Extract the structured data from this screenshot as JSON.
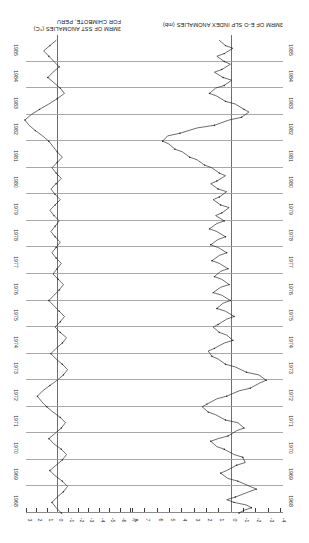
{
  "figure": {
    "rotation_degrees": 180,
    "background": "#ffffff",
    "line_color": "#1d1d1d",
    "grid_color": "#9a9a9a",
    "axis_color": "#2b2b2b"
  },
  "captions": {
    "slp": {
      "line1": "3MRM OF E-O SLP INDEX ANOMALIES (mb)"
    },
    "sst": {
      "line1": "3MRM OF SST ANOMALIES (°C)",
      "line2": "FOR CHIMBOTE, PERU"
    }
  },
  "axes": {
    "slp_ticks": [
      "-4",
      "-3",
      "-2",
      "-1",
      "0",
      "1",
      "2",
      "3",
      "4",
      "5",
      "6",
      "7",
      "8"
    ],
    "sst_ticks": [
      "-7",
      "-6",
      "-5",
      "-4",
      "-3",
      "-2",
      "-1",
      "0",
      "1",
      "2",
      "3"
    ],
    "years": [
      "1968",
      "1969",
      "1970",
      "1971",
      "1972",
      "1973",
      "1974",
      "1975",
      "1976",
      "1977",
      "1978",
      "1979",
      "1980",
      "1981",
      "1982",
      "1983",
      "1984",
      "1985"
    ],
    "time_axis_label": "YEAR",
    "time_range": [
      "1968",
      "1985"
    ]
  },
  "chart_data": {
    "type": "line",
    "title": "",
    "subtitle": "",
    "orientation": "time-on-vertical-axis",
    "xlabel": "Anomaly",
    "ylabel": "Year",
    "grid": true,
    "legend": "none",
    "series": [
      {
        "name": "3MRM OF E-O SLP INDEX ANOMALIES (mb)",
        "units": "mb",
        "xlim": [
          -4,
          8
        ],
        "zero_reference": 0,
        "x": [
          1968.0,
          1968.1,
          1968.2,
          1968.3,
          1968.4,
          1968.5,
          1968.6,
          1968.8,
          1968.9,
          1969.0,
          1969.2,
          1969.3,
          1969.5,
          1969.6,
          1969.8,
          1969.9,
          1970.1,
          1970.2,
          1970.4,
          1970.5,
          1970.7,
          1970.8,
          1970.9,
          1971.1,
          1971.2,
          1971.4,
          1971.5,
          1971.7,
          1971.8,
          1972.0,
          1972.1,
          1972.3,
          1972.4,
          1972.6,
          1972.7,
          1972.9,
          1973.0,
          1973.2,
          1973.3,
          1973.5,
          1973.6,
          1973.8,
          1973.9,
          1974.1,
          1974.2,
          1974.4,
          1974.5,
          1974.7,
          1974.8,
          1975.0,
          1975.1,
          1975.3,
          1975.4,
          1975.6,
          1975.7,
          1975.9,
          1976.0,
          1976.2,
          1976.3,
          1976.5,
          1976.6,
          1976.8,
          1976.9,
          1977.1,
          1977.2,
          1977.4,
          1977.5,
          1977.7,
          1977.8,
          1978.0,
          1978.1,
          1978.3,
          1978.4,
          1978.6,
          1978.7,
          1978.9,
          1979.0,
          1979.2,
          1979.3,
          1979.5,
          1979.6,
          1979.8,
          1979.9,
          1980.1,
          1980.2,
          1980.4,
          1980.5,
          1980.7,
          1980.8,
          1981.0,
          1981.1,
          1981.3,
          1981.4,
          1981.6,
          1981.7,
          1981.9,
          1982.0,
          1982.2,
          1982.3,
          1982.5,
          1982.6,
          1982.8,
          1982.9,
          1983.1,
          1983.2,
          1983.4,
          1983.5,
          1983.7,
          1983.8,
          1984.0,
          1984.1,
          1984.3,
          1984.4,
          1984.6,
          1984.7,
          1984.9,
          1985.0,
          1985.2,
          1985.3,
          1985.5,
          1985.6,
          1985.8
        ],
        "values": [
          -0.6,
          -1.0,
          -1.6,
          -1.2,
          -0.2,
          0.4,
          -0.3,
          -1.4,
          -2.0,
          -1.5,
          -0.5,
          0.3,
          0.9,
          0.4,
          -0.4,
          -1.1,
          -0.9,
          -0.2,
          0.6,
          1.2,
          1.7,
          1.1,
          0.3,
          -0.4,
          -1.0,
          -0.5,
          0.5,
          1.3,
          1.9,
          2.4,
          2.0,
          1.2,
          0.4,
          -0.6,
          -1.5,
          -2.3,
          -2.8,
          -2.2,
          -1.2,
          -0.3,
          0.5,
          1.1,
          1.6,
          1.9,
          1.4,
          0.6,
          -0.1,
          0.4,
          1.0,
          1.5,
          1.1,
          0.4,
          -0.2,
          0.5,
          1.2,
          0.7,
          0.1,
          0.8,
          1.5,
          0.9,
          0.2,
          0.8,
          1.4,
          0.9,
          0.3,
          1.0,
          1.6,
          1.0,
          0.4,
          1.1,
          1.7,
          1.1,
          0.5,
          1.2,
          1.8,
          1.2,
          0.6,
          1.3,
          0.8,
          0.2,
          0.9,
          1.5,
          1.0,
          0.4,
          1.1,
          1.7,
          1.2,
          0.5,
          1.0,
          1.6,
          2.2,
          2.8,
          3.4,
          4.0,
          4.6,
          5.1,
          5.6,
          5.2,
          4.2,
          2.8,
          1.4,
          0.2,
          -0.8,
          -1.4,
          -1.0,
          -0.3,
          0.5,
          1.2,
          1.8,
          1.3,
          0.6,
          0.0,
          0.7,
          1.4,
          0.8,
          0.1,
          0.6,
          1.2,
          0.6,
          -0.1,
          0.5,
          1.0
        ]
      },
      {
        "name": "3MRM OF SST ANOMALIES (°C) FOR CHIMBOTE, PERU",
        "units": "°C",
        "xlim": [
          -7,
          3
        ],
        "zero_reference": 0,
        "x": [
          1968.0,
          1968.2,
          1968.4,
          1968.6,
          1968.8,
          1969.0,
          1969.2,
          1969.4,
          1969.6,
          1969.8,
          1970.0,
          1970.2,
          1970.4,
          1970.6,
          1970.8,
          1971.0,
          1971.2,
          1971.4,
          1971.6,
          1971.8,
          1972.0,
          1972.2,
          1972.4,
          1972.6,
          1972.8,
          1973.0,
          1973.2,
          1973.4,
          1973.6,
          1973.8,
          1974.0,
          1974.2,
          1974.4,
          1974.6,
          1974.8,
          1975.0,
          1975.2,
          1975.4,
          1975.6,
          1975.8,
          1976.0,
          1976.2,
          1976.4,
          1976.6,
          1976.8,
          1977.0,
          1977.2,
          1977.4,
          1977.6,
          1977.8,
          1978.0,
          1978.2,
          1978.4,
          1978.6,
          1978.8,
          1979.0,
          1979.2,
          1979.4,
          1979.6,
          1979.8,
          1980.0,
          1980.2,
          1980.4,
          1980.6,
          1980.8,
          1981.0,
          1981.2,
          1981.4,
          1981.6,
          1981.8,
          1982.0,
          1982.2,
          1982.4,
          1982.6,
          1982.8,
          1983.0,
          1983.2,
          1983.4,
          1983.6,
          1983.8,
          1984.0,
          1984.2,
          1984.4,
          1984.6,
          1984.8,
          1985.0,
          1985.2,
          1985.4,
          1985.6,
          1985.8
        ],
        "values": [
          -0.3,
          0.2,
          0.6,
          0.1,
          -0.5,
          -0.9,
          -0.4,
          0.3,
          0.8,
          0.2,
          -0.4,
          -0.8,
          -0.3,
          0.4,
          0.9,
          0.3,
          -0.3,
          -0.7,
          -0.2,
          0.5,
          1.1,
          1.6,
          2.0,
          1.5,
          0.8,
          0.1,
          -0.5,
          -0.9,
          -0.4,
          0.2,
          0.7,
          0.2,
          -0.4,
          -0.8,
          -0.2,
          0.3,
          -0.2,
          -0.6,
          -0.1,
          0.4,
          0.9,
          0.4,
          -0.1,
          -0.5,
          0.0,
          0.5,
          0.1,
          -0.3,
          0.2,
          0.6,
          0.2,
          -0.2,
          0.3,
          0.7,
          0.3,
          -0.1,
          0.4,
          0.8,
          0.3,
          -0.2,
          0.3,
          0.7,
          0.2,
          -0.3,
          0.2,
          0.6,
          0.1,
          -0.4,
          0.1,
          0.5,
          0.9,
          1.5,
          2.2,
          2.8,
          3.2,
          2.6,
          1.8,
          0.9,
          0.1,
          -0.6,
          -0.2,
          0.4,
          1.0,
          0.5,
          -0.1,
          0.4,
          0.9,
          1.4,
          0.8,
          0.2
        ]
      }
    ]
  }
}
